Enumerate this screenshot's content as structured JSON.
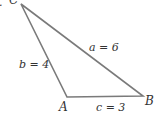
{
  "figure": {
    "marker": ".",
    "vertices": {
      "C": {
        "label": "C",
        "x": 21,
        "y": 4
      },
      "A": {
        "label": "A",
        "x": 67,
        "y": 97
      },
      "B": {
        "label": "B",
        "x": 143,
        "y": 96
      }
    },
    "sides": {
      "a": {
        "label": "a = 6"
      },
      "b": {
        "label": "b = 4"
      },
      "c": {
        "label": "c = 3"
      }
    },
    "stroke_color": "#7a7a7a",
    "text_color": "#333333"
  }
}
